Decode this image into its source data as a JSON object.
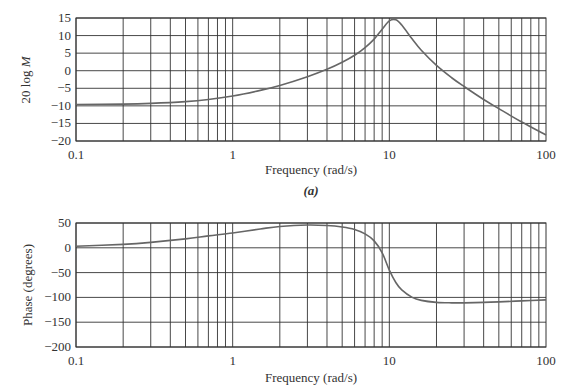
{
  "chart_data": [
    {
      "type": "line",
      "id": "magnitude",
      "title": "",
      "caption": "(a)",
      "xlabel": "Frequency (rad/s)",
      "ylabel": "20 log M",
      "xscale": "log",
      "xlim": [
        0.1,
        100
      ],
      "ylim": [
        -20,
        15
      ],
      "x_ticks": [
        "0.1",
        "1",
        "10",
        "100"
      ],
      "y_ticks": [
        "15",
        "10",
        "5",
        "0",
        "-5",
        "-10",
        "-15",
        "-20"
      ],
      "grid": true,
      "series": [
        {
          "name": "magnitude",
          "x": [
            0.1,
            0.2,
            0.3,
            0.5,
            0.7,
            1,
            1.5,
            2,
            3,
            4,
            5,
            6,
            7,
            8,
            9,
            10,
            11,
            12,
            14,
            16,
            20,
            25,
            30,
            40,
            50,
            70,
            100
          ],
          "y": [
            -9.6,
            -9.5,
            -9.3,
            -8.8,
            -8.2,
            -7.2,
            -5.6,
            -4.2,
            -1.7,
            0.4,
            2.4,
            4.4,
            6.6,
            9.0,
            11.8,
            14.2,
            14.5,
            13.0,
            9.0,
            5.8,
            1.5,
            -2.0,
            -4.5,
            -8.2,
            -10.8,
            -14.6,
            -18.3
          ]
        }
      ]
    },
    {
      "type": "line",
      "id": "phase",
      "title": "",
      "caption": "",
      "xlabel": "Frequency (rad/s)",
      "ylabel": "Phase (degrees)",
      "xscale": "log",
      "xlim": [
        0.1,
        100
      ],
      "ylim": [
        -200,
        50
      ],
      "x_ticks": [
        "0.1",
        "1",
        "10",
        "100"
      ],
      "y_ticks": [
        "50",
        "0",
        "-50",
        "-100",
        "-150",
        "-200"
      ],
      "grid": true,
      "series": [
        {
          "name": "phase",
          "x": [
            0.1,
            0.2,
            0.3,
            0.5,
            0.7,
            1,
            1.5,
            2,
            3,
            4,
            5,
            6,
            7,
            8,
            9,
            10,
            11,
            12,
            14,
            16,
            20,
            25,
            30,
            40,
            50,
            70,
            100
          ],
          "y": [
            3,
            7,
            11,
            18,
            24,
            30,
            38,
            43,
            46,
            45,
            42,
            37,
            28,
            14,
            -10,
            -45,
            -70,
            -85,
            -100,
            -106,
            -110,
            -111,
            -111,
            -110,
            -109,
            -107,
            -105
          ]
        }
      ]
    }
  ],
  "labels": {
    "top_ylabel_prefix": "20 log ",
    "top_ylabel_var": "M",
    "top_xlabel": "Frequency (rad/s)",
    "top_caption": "(a)",
    "bottom_ylabel": "Phase (degrees)",
    "bottom_xlabel": "Frequency (rad/s)"
  }
}
